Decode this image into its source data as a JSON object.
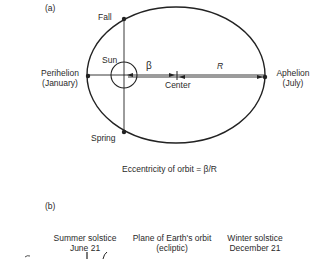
{
  "panel_a": {
    "label": "(a)",
    "fall": "Fall",
    "spring": "Spring",
    "sun": "Sun",
    "beta": "β",
    "r": "R",
    "center": "Center",
    "perihelion": "Perihelion",
    "perihelion_month": "(January)",
    "aphelion": "Aphelion",
    "aphelion_month": "(July)",
    "eccentricity": "Eccentricity of orbit = β/R"
  },
  "panel_b": {
    "label": "(b)",
    "summer_solstice": "Summer solstice",
    "summer_date": "June 21",
    "plane": "Plane of Earth's orbit",
    "plane_sub": "(ecliptic)",
    "winter_solstice": "Winter solstice",
    "winter_date": "December 21"
  },
  "colors": {
    "ink": "#222222",
    "background": "#ffffff"
  }
}
